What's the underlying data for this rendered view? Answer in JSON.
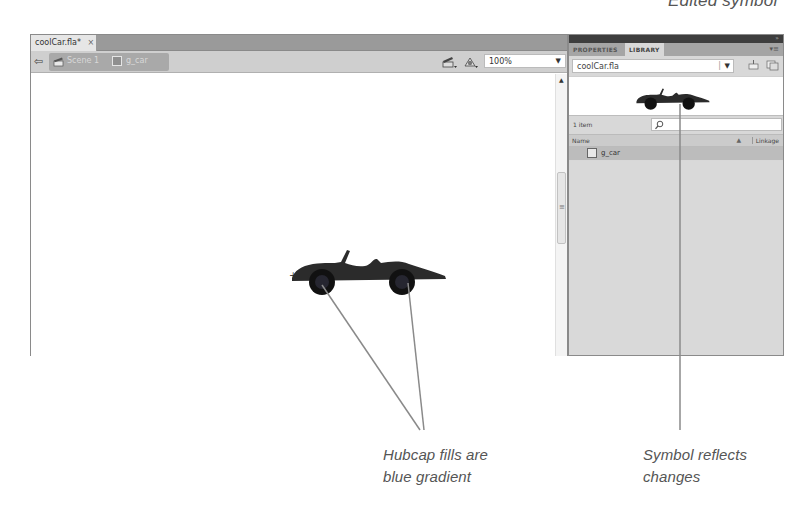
{
  "annotations": {
    "top_caption": "Edited symbol",
    "hubcap_caption_line1": "Hubcap fills are",
    "hubcap_caption_line2": "blue gradient",
    "symbol_caption_line1": "Symbol reflects",
    "symbol_caption_line2": "changes"
  },
  "document": {
    "tab_label": "coolCar.fla*",
    "tab_close": "×",
    "back_icon": "arrow-left-icon",
    "breadcrumbs": [
      {
        "label": "Scene 1",
        "icon": "scene-clapper-icon"
      },
      {
        "label": "g_car",
        "icon": "graphic-symbol-icon"
      }
    ],
    "edit_scene_icon": "edit-scene-icon",
    "edit_symbol_icon": "edit-symbols-icon",
    "zoom": "100%",
    "stage_registration": "+"
  },
  "panel": {
    "tabs": [
      {
        "label": "PROPERTIES",
        "active": false
      },
      {
        "label": "LIBRARY",
        "active": true
      }
    ],
    "library_file": "coolCar.fla",
    "item_count": "1 item",
    "search_placeholder": "",
    "columns": {
      "name": "Name",
      "linkage": "Linkage"
    },
    "items": [
      {
        "name": "g_car",
        "type": "graphic"
      }
    ]
  },
  "colors": {
    "tab_bar": "#9a9a9a",
    "edit_bar": "#cfcfcf",
    "panel_bg": "#d8d8d8",
    "panel_top": "#3e3e3e",
    "selected_item": "#bcbcbc",
    "callout_line": "#8a8a8a",
    "car_body": "#2b2b2b"
  }
}
